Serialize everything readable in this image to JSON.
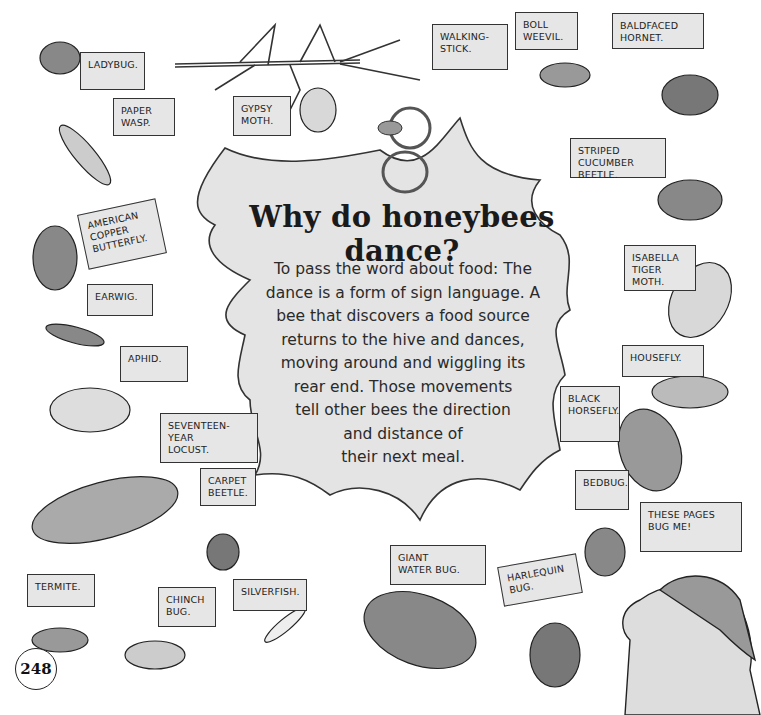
{
  "page": {
    "number": "248",
    "heading": "Why do honeybees dance?",
    "body_lines": [
      "To pass the word about food: The",
      "dance is a form of sign language. A",
      "bee that discovers a food source",
      "returns to the hive and dances,",
      "moving around and wiggling its",
      "rear end. Those movements",
      "tell other bees the direction",
      "and distance of",
      "their next meal."
    ]
  },
  "labels": {
    "ladybug": "Ladybug.",
    "paper_wasp": "Paper\nWasp.",
    "gypsy_moth": "Gypsy\nMoth.",
    "walking_stick": "Walking-\nStick.",
    "boll_weevil": "Boll\nWeevil.",
    "baldfaced_hornet": "Baldfaced\nHornet.",
    "striped_cucumber_beetle": "Striped\nCucumber Beetle.",
    "american_copper_butterfly": "American\nCopper\nButterfly.",
    "earwig": "Earwig.",
    "aphid": "Aphid.",
    "isabella_tiger_moth": "Isabella\nTiger Moth.",
    "housefly": "Housefly.",
    "black_horsefly": "Black\nHorsefly.",
    "seventeen_year_locust": "Seventeen-Year\nLocust.",
    "carpet_beetle": "Carpet\nBeetle.",
    "bedbug": "Bedbug.",
    "these_pages": "These Pages\nBug Me!",
    "giant_water_bug": "Giant\nWater Bug.",
    "harlequin_bug": "Harlequin\nBug.",
    "termite": "Termite.",
    "chinch_bug": "Chinch\nBug.",
    "silverfish": "Silverfish."
  },
  "colors": {
    "bubble_fill": "#e4e4e4",
    "label_fill": "#e6e6e6",
    "ink": "#222222"
  }
}
